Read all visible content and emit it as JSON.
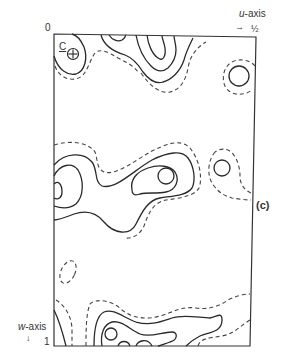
{
  "diagram": {
    "type": "contour-map",
    "panel_label": "(c)",
    "origin_label": "0",
    "u_axis": {
      "name": "u",
      "suffix": "-axis",
      "arrow": "→",
      "end_label": "½"
    },
    "w_axis": {
      "name": "w",
      "suffix": "-axis",
      "arrow": "↓",
      "end_label": "1"
    },
    "atom_label": "C",
    "atom_marker": "⊕",
    "line_styles": {
      "solid": "positive contour",
      "dashed": "zero/low contour"
    },
    "colors": {
      "ink": "#2a2a2a",
      "background": "#ffffff"
    }
  }
}
